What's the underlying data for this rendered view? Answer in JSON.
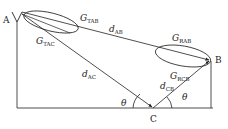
{
  "diagram": {
    "nodes": {
      "A": "A",
      "B": "B",
      "C": "C"
    },
    "gains": {
      "g_tab": {
        "main": "G",
        "sub": "TAB"
      },
      "g_tac": {
        "main": "G",
        "sub": "TAC"
      },
      "g_rab": {
        "main": "G",
        "sub": "RAB"
      },
      "g_rcb": {
        "main": "G",
        "sub": "RCB"
      }
    },
    "distances": {
      "d_ab": {
        "main": "d",
        "sub": "AB"
      },
      "d_ac": {
        "main": "d",
        "sub": "AC"
      },
      "d_cb": {
        "main": "d",
        "sub": "CB"
      }
    },
    "angles": {
      "theta_left": "θ",
      "theta_right": "θ"
    },
    "colors": {
      "stroke": "#222222",
      "background": "#ffffff"
    }
  }
}
